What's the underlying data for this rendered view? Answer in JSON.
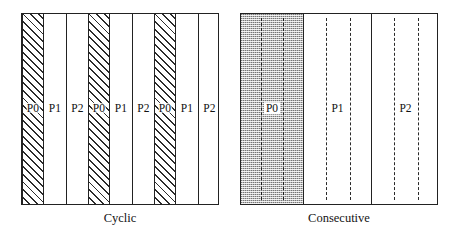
{
  "figure": {
    "title": "",
    "colors": {
      "outline": "#222222",
      "hatch": "#2b2b2b",
      "shade_fill": "#b9b9b9",
      "background": "#ffffff",
      "text": "#111111"
    }
  },
  "panels": [
    {
      "id": "cyclic",
      "caption": "Cyclic",
      "pattern": "alternating hatched / plain vertical stripes",
      "stripes": [
        {
          "label": "P0",
          "fill": "hatched"
        },
        {
          "label": "P1",
          "fill": "plain"
        },
        {
          "label": "P2",
          "fill": "plain"
        },
        {
          "label": "P0",
          "fill": "hatched"
        },
        {
          "label": "P1",
          "fill": "plain"
        },
        {
          "label": "P2",
          "fill": "plain"
        },
        {
          "label": "P0",
          "fill": "hatched"
        },
        {
          "label": "P1",
          "fill": "plain"
        },
        {
          "label": "P2",
          "fill": "plain"
        }
      ]
    },
    {
      "id": "consecutive",
      "caption": "Consecutive",
      "pattern": "three contiguous blocks, first one shaded",
      "blocks": [
        {
          "label": "P0",
          "fill": "shaded",
          "dashed_columns": 2
        },
        {
          "label": "P1",
          "fill": "plain",
          "dashed_columns": 2
        },
        {
          "label": "P2",
          "fill": "plain",
          "dashed_columns": 2
        }
      ]
    }
  ]
}
